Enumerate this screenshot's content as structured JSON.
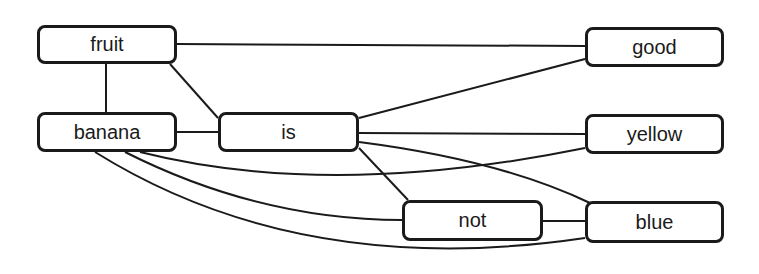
{
  "diagram": {
    "type": "word-graph",
    "nodes": [
      {
        "id": "fruit",
        "label": "fruit",
        "x": 37,
        "y": 25,
        "w": 140,
        "h": 39
      },
      {
        "id": "banana",
        "label": "banana",
        "x": 37,
        "y": 112,
        "w": 140,
        "h": 40
      },
      {
        "id": "is",
        "label": "is",
        "x": 218,
        "y": 112,
        "w": 141,
        "h": 40
      },
      {
        "id": "good",
        "label": "good",
        "x": 585,
        "y": 27,
        "w": 139,
        "h": 40
      },
      {
        "id": "yellow",
        "label": "yellow",
        "x": 585,
        "y": 114,
        "w": 139,
        "h": 40
      },
      {
        "id": "not",
        "label": "not",
        "x": 402,
        "y": 200,
        "w": 141,
        "h": 41
      },
      {
        "id": "blue",
        "label": "blue",
        "x": 585,
        "y": 201,
        "w": 139,
        "h": 42
      }
    ],
    "edges": [
      {
        "from": "fruit",
        "to": "good",
        "d": "M177 44 L585 46"
      },
      {
        "from": "fruit",
        "to": "banana",
        "d": "M106 64 L106 112"
      },
      {
        "from": "fruit",
        "to": "is",
        "d": "M170 64 L218 118"
      },
      {
        "from": "banana",
        "to": "is",
        "d": "M177 132 L218 132"
      },
      {
        "from": "is",
        "to": "good",
        "d": "M359 118 L585 59"
      },
      {
        "from": "is",
        "to": "yellow",
        "d": "M359 133 L585 134"
      },
      {
        "from": "is",
        "to": "not",
        "d": "M359 148 L408 200"
      },
      {
        "from": "is",
        "to": "blue",
        "d": "M359 142 Q500 160 590 203"
      },
      {
        "from": "not",
        "to": "blue",
        "d": "M543 221 L585 221"
      },
      {
        "from": "banana",
        "to": "yellow",
        "d": "M140 152 Q330 200 585 148"
      },
      {
        "from": "banana",
        "to": "not",
        "d": "M125 152 Q260 220 402 220"
      },
      {
        "from": "banana",
        "to": "blue",
        "d": "M95 152 Q300 280 585 238"
      }
    ]
  }
}
